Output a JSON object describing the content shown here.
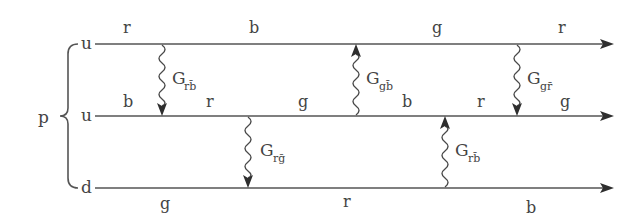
{
  "particle": "p",
  "quarks": [
    {
      "label": "u",
      "y": 44
    },
    {
      "label": "u",
      "y": 116
    },
    {
      "label": "d",
      "y": 188
    }
  ],
  "color_labels": {
    "line1": [
      {
        "text": "r",
        "x": 127,
        "y": 33
      },
      {
        "text": "b",
        "x": 254,
        "y": 33
      },
      {
        "text": "g",
        "x": 437,
        "y": 33
      },
      {
        "text": "r",
        "x": 562,
        "y": 33
      }
    ],
    "line2": [
      {
        "text": "b",
        "x": 128,
        "y": 105
      },
      {
        "text": "r",
        "x": 210,
        "y": 105
      },
      {
        "text": "g",
        "x": 303,
        "y": 105
      },
      {
        "text": "b",
        "x": 407,
        "y": 105
      },
      {
        "text": "r",
        "x": 480,
        "y": 105
      },
      {
        "text": "g",
        "x": 565,
        "y": 105
      }
    ],
    "line3": [
      {
        "text": "g",
        "x": 165,
        "y": 207
      },
      {
        "text": "r",
        "x": 346,
        "y": 207
      },
      {
        "text": "b",
        "x": 531,
        "y": 211
      }
    ]
  },
  "gluons": [
    {
      "name": "G",
      "sub": "rb̄",
      "x": 162,
      "from": 44,
      "to": 116,
      "direction": "down",
      "label_x": 172,
      "label_y": 80
    },
    {
      "name": "G",
      "sub": "gb̄",
      "x": 356,
      "from": 116,
      "to": 44,
      "direction": "up",
      "label_x": 366,
      "label_y": 80
    },
    {
      "name": "G",
      "sub": "gr̄",
      "x": 517,
      "from": 44,
      "to": 116,
      "direction": "down",
      "label_x": 527,
      "label_y": 80
    },
    {
      "name": "G",
      "sub": "rḡ",
      "x": 248,
      "from": 116,
      "to": 188,
      "direction": "down",
      "label_x": 260,
      "label_y": 155
    },
    {
      "name": "G",
      "sub": "rb̄",
      "x": 445,
      "from": 188,
      "to": 116,
      "direction": "up",
      "label_x": 455,
      "label_y": 155
    }
  ],
  "text": {
    "p": "p",
    "q1": "u",
    "q2": "u",
    "q3": "d",
    "l1c1": "r",
    "l1c2": "b",
    "l1c3": "g",
    "l1c4": "r",
    "l2c1": "b",
    "l2c2": "r",
    "l2c3": "g",
    "l2c4": "b",
    "l2c5": "r",
    "l2c6": "g",
    "l3c1": "g",
    "l3c2": "r",
    "l3c3": "b",
    "g1": "G",
    "g1s": "rb̄",
    "g2": "G",
    "g2s": "gb̄",
    "g3": "G",
    "g3s": "gr̄",
    "g4": "G",
    "g4s": "rḡ",
    "g5": "G",
    "g5s": "rb̄"
  },
  "colors": {
    "line": "#555555",
    "text": "#444444",
    "background": "#ffffff"
  }
}
